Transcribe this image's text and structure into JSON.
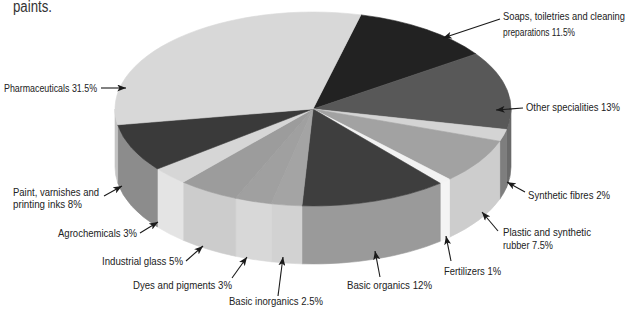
{
  "page": {
    "top_text": "paints."
  },
  "chart_data": {
    "type": "pie",
    "style": "3d",
    "title": "",
    "xlabel": "",
    "ylabel": "",
    "unit": "%",
    "start_angle_deg": -76,
    "direction": "clockwise",
    "legend": "none (direct labels with arrows)",
    "categories": [
      "Soaps, toiletries and cleaning preparations",
      "Other specialities",
      "Synthetic fibres",
      "Plastic and synthetic rubber",
      "Fertilizers",
      "Basic organics",
      "Basic inorganics",
      "Dyes and pigments",
      "Industrial glass",
      "Agrochemicals",
      "Paint, varnishes and printing inks",
      "Pharmaceuticals"
    ],
    "values": [
      11.5,
      13,
      2,
      7.5,
      1,
      12,
      2.5,
      3,
      5,
      3,
      8,
      31.5
    ],
    "colors_top": [
      "#222222",
      "#585858",
      "#d4d4d4",
      "#a2a2a2",
      "#f2f2f2",
      "#3e3e3e",
      "#a4a4a4",
      "#a0a0a0",
      "#9c9c9c",
      "#d6d6d6",
      "#3a3a3a",
      "#d8d8d8"
    ],
    "colors_side": [
      "#3a3a3a",
      "#6a6a6a",
      "#7e7e7e",
      "#cdcdcd",
      "#f4f4f4",
      "#9a9a9a",
      "#d2d2d2",
      "#d8d8d8",
      "#cccccc",
      "#e4e4e4",
      "#8c8c8c",
      "#c4c4c4"
    ],
    "labels": [
      {
        "lines": [
          "Soaps, toiletries and cleaning",
          "preparations 11.5%"
        ]
      },
      {
        "lines": [
          "Other specialities 13%"
        ]
      },
      {
        "lines": [
          "Synthetic fibres 2%"
        ]
      },
      {
        "lines": [
          "Plastic and synthetic",
          "rubber 7.5%"
        ]
      },
      {
        "lines": [
          "Fertilizers 1%"
        ]
      },
      {
        "lines": [
          "Basic organics 12%"
        ]
      },
      {
        "lines": [
          "Basic inorganics 2.5%"
        ]
      },
      {
        "lines": [
          "Dyes and pigments 3%"
        ]
      },
      {
        "lines": [
          "Industrial glass 5%"
        ]
      },
      {
        "lines": [
          "Agrochemicals 3%"
        ]
      },
      {
        "lines": [
          "Paint, varnishes and",
          "printing inks 8%"
        ]
      },
      {
        "lines": [
          "Pharmaceuticals 31.5%"
        ]
      }
    ]
  }
}
